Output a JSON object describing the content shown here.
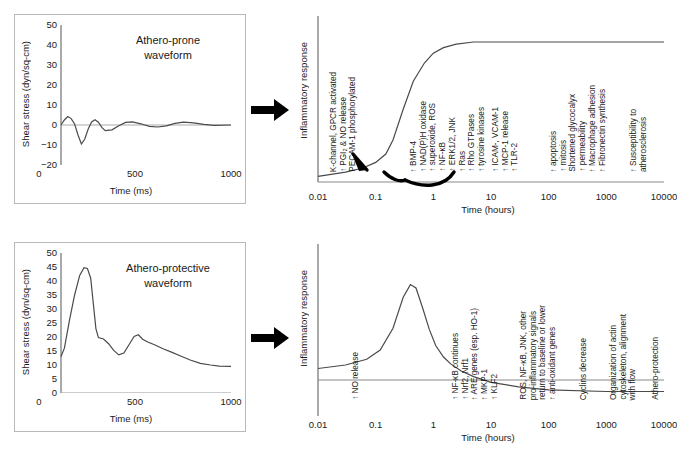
{
  "chart_data": [
    {
      "id": "athero-prone-waveform",
      "type": "line",
      "title": "Athero-prone waveform",
      "xlabel": "Time (ms)",
      "ylabel": "Shear stress (dyn/sq-cm)",
      "xlim": [
        0,
        1000
      ],
      "ylim": [
        -20,
        50
      ],
      "xticks": [
        0,
        500,
        1000
      ],
      "yticks": [
        50,
        40,
        30,
        20,
        10,
        0,
        -10,
        -20
      ],
      "grid": false,
      "zero_line": true,
      "x": [
        0,
        20,
        40,
        60,
        80,
        100,
        120,
        140,
        160,
        180,
        200,
        220,
        240,
        260,
        300,
        340,
        380,
        420,
        470,
        520,
        570,
        620,
        670,
        720,
        780,
        840,
        900,
        1000
      ],
      "y": [
        0,
        2.5,
        4.2,
        3.2,
        0.5,
        -5,
        -9.5,
        -7,
        -2,
        1.5,
        2.6,
        1.4,
        -1.2,
        -2.8,
        -2.4,
        -0.4,
        1.3,
        1.6,
        0.6,
        -0.7,
        -1.0,
        -0.4,
        0.8,
        1.4,
        1.1,
        0.3,
        -0.2,
        0.0
      ]
    },
    {
      "id": "athero-protective-waveform",
      "type": "line",
      "title": "Athero-protective waveform",
      "xlabel": "Time (ms)",
      "ylabel": "Shear stress (dyn/sq-cm)",
      "xlim": [
        0,
        1000
      ],
      "ylim": [
        0,
        50
      ],
      "xticks": [
        0,
        500,
        1000
      ],
      "yticks": [
        50,
        45,
        40,
        35,
        30,
        25,
        20,
        15,
        10,
        5,
        0
      ],
      "grid": false,
      "zero_line": false,
      "x": [
        0,
        20,
        50,
        80,
        110,
        135,
        155,
        175,
        190,
        205,
        220,
        250,
        280,
        310,
        340,
        370,
        400,
        430,
        455,
        480,
        510,
        550,
        600,
        650,
        700,
        760,
        820,
        880,
        930,
        1000
      ],
      "y": [
        13,
        16,
        26,
        35,
        42,
        44.8,
        44.5,
        41,
        32,
        23,
        19.8,
        19.3,
        17.6,
        15.2,
        13.6,
        14.3,
        17.2,
        20.2,
        20.8,
        19.2,
        18.2,
        17.2,
        15.8,
        14.6,
        13.3,
        11.8,
        10.6,
        10.0,
        9.6,
        9.5
      ]
    },
    {
      "id": "athero-prone-response",
      "type": "line",
      "title": "",
      "xlabel": "Time (hours)",
      "ylabel": "Inflammatory response",
      "xscale": "log",
      "xlim": [
        0.01,
        10000
      ],
      "xticks": [
        0.01,
        0.1,
        1,
        10,
        100,
        1000,
        10000
      ],
      "xticklabels": [
        "0.01",
        "0.1",
        "1",
        "10",
        "100",
        "1000",
        "10000"
      ],
      "grid": false,
      "shape": "sigmoid rising from low baseline at 0.01, steep rise between 0.1 and 1, plateau at high level from ~2 to 10000",
      "x": [
        0.01,
        0.03,
        0.06,
        0.1,
        0.15,
        0.2,
        0.3,
        0.45,
        0.7,
        1,
        1.5,
        2.5,
        5,
        20,
        100,
        1000,
        10000
      ],
      "y": [
        0.04,
        0.07,
        0.1,
        0.14,
        0.2,
        0.3,
        0.52,
        0.72,
        0.85,
        0.92,
        0.96,
        0.985,
        1.0,
        1.0,
        1.0,
        1.0,
        1.0
      ],
      "curved_arrow": true
    },
    {
      "id": "athero-protective-response",
      "type": "line",
      "title": "",
      "xlabel": "Time (hours)",
      "ylabel": "Inflammatory response",
      "xscale": "log",
      "xlim": [
        0.01,
        10000
      ],
      "xticks": [
        0.01,
        0.1,
        1,
        10,
        100,
        1000,
        10000
      ],
      "xticklabels": [
        "0.01",
        "0.1",
        "1",
        "10",
        "100",
        "1000",
        "10000"
      ],
      "grid": false,
      "baseline": true,
      "shape": "transient peak near 0.4 h then decay crossing baseline at ~3 h and settling below baseline",
      "x": [
        0.01,
        0.03,
        0.07,
        0.12,
        0.2,
        0.3,
        0.4,
        0.5,
        0.65,
        0.85,
        1.1,
        1.5,
        2,
        3,
        5,
        10,
        30,
        100,
        1000,
        10000
      ],
      "y": [
        0.1,
        0.13,
        0.18,
        0.26,
        0.45,
        0.72,
        0.83,
        0.8,
        0.63,
        0.44,
        0.3,
        0.2,
        0.14,
        0.08,
        0.03,
        -0.02,
        -0.06,
        -0.085,
        -0.1,
        -0.1
      ]
    }
  ],
  "top": {
    "waveform": {
      "title_line1": "Athero-prone",
      "title_line2": "waveform",
      "ylabel": "Shear stress (dyn/sq-cm)",
      "xlabel": "Time (ms)",
      "yticks": [
        "50",
        "40",
        "30",
        "20",
        "10",
        "0",
        "−10",
        "−20"
      ],
      "xticks": [
        "0",
        "500",
        "1000"
      ]
    },
    "arrow_name": "right-block-arrow",
    "response": {
      "ylabel": "Inflammatory response",
      "xlabel": "Time (hours)",
      "xticks": [
        "0.01",
        "0.1",
        "1",
        "10",
        "100",
        "1000",
        "10000"
      ],
      "annotations": [
        {
          "name": "early-signaling",
          "lines": [
            "K-channel, GPCR activated",
            "↑ PGI₂ & NO release",
            "PECAM-1 phosphorylated"
          ]
        },
        {
          "name": "signaling-cascade",
          "lines": [
            "↑ BMP-4",
            "↑ NAD(P)H oxidase",
            "↑ superoxide, ROS",
            "↑ NF-κB",
            "↑ ERK1/2, JNK",
            "↑ Ras",
            "↑ Rho GTPases",
            "↑ tyrosine kinases"
          ]
        },
        {
          "name": "adhesion-molecules",
          "lines": [
            "↑ ICAM-, VCAM-1",
            "↑ MCP-1 release",
            "↑ TLR-2"
          ]
        },
        {
          "name": "cellular-phenotype",
          "lines": [
            "↑ apoptosis",
            "↑ mitosis",
            "Shortened glycocalyx",
            "↑ permeability",
            "↑ Macrophage adhesion",
            "↑ Fibronectin synthesis"
          ]
        },
        {
          "name": "disease-outcome",
          "lines": [
            "↑ Susceptibility to",
            "atherosclerosis"
          ]
        }
      ]
    }
  },
  "bottom": {
    "waveform": {
      "title_line1": "Athero-protective",
      "title_line2": "waveform",
      "ylabel": "Shear stress (dyn/sq-cm)",
      "xlabel": "Time (ms)",
      "yticks": [
        "50",
        "45",
        "40",
        "35",
        "30",
        "25",
        "20",
        "15",
        "10",
        "5",
        "0"
      ],
      "xticks": [
        "0",
        "500",
        "1000"
      ]
    },
    "arrow_name": "right-block-arrow",
    "response": {
      "ylabel": "Inflammatory response",
      "xlabel": "Time (hours)",
      "xticks": [
        "0.01",
        "0.1",
        "1",
        "10",
        "100",
        "1000",
        "10000"
      ],
      "annotations": [
        {
          "name": "no-release",
          "lines": [
            "↑ NO release"
          ]
        },
        {
          "name": "antioxidant-genes",
          "lines": [
            "↑ NF-κB continues",
            "↑ Nrf2, Nrf1",
            "↑ ARE genes (esp. HO-1)",
            "↑ MKP-1",
            "↑ KLF2"
          ]
        },
        {
          "name": "signal-resolution",
          "lines": [
            "ROS, NF-κB, JNK, other",
            "pro-inflammatory signals",
            "return to baseline or lower",
            "↑ anti-oxidant genes"
          ]
        },
        {
          "name": "cyclins-decrease",
          "lines": [
            "Cyclins decrease"
          ]
        },
        {
          "name": "cytoskeletal-alignment",
          "lines": [
            "Organization of actin",
            "cytoskeleton, alignment",
            "with flow"
          ]
        },
        {
          "name": "athero-protection",
          "lines": [
            "Athero-protection"
          ]
        }
      ]
    }
  }
}
